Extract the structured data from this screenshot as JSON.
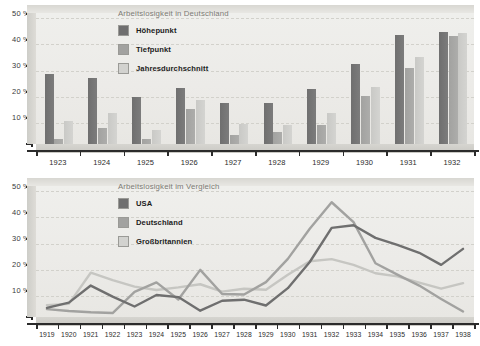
{
  "charts": [
    {
      "id": "unemployment-germany",
      "title": "Arbeitslosigkeit in Deutschland",
      "type": "bar",
      "xlabel": "",
      "ylabel": "",
      "ylim": [
        0,
        50
      ],
      "yticks": [
        "10 %",
        "20 %",
        "30 %",
        "40 %",
        "50 %"
      ],
      "ytick_values": [
        10,
        20,
        30,
        40,
        50
      ],
      "grid": true,
      "legend_position": "top-center",
      "categories": [
        "1923",
        "1924",
        "1925",
        "1926",
        "1927",
        "1928",
        "1929",
        "1930",
        "1931",
        "1932"
      ],
      "series": [
        {
          "name": "Höhepunkt",
          "color": "#6f6f6f",
          "values": [
            26.8,
            25.1,
            18.1,
            21.4,
            15.7,
            15.5,
            21.1,
            30.5,
            41.6,
            42.6
          ]
        },
        {
          "name": "Tiefpunkt",
          "color": "#a2a2a0",
          "values": [
            2.0,
            6.1,
            2.0,
            13.2,
            3.3,
            4.7,
            7.3,
            18.3,
            29.0,
            41.4
          ]
        },
        {
          "name": "Jahresdurchschnitt",
          "color": "#d2d2cf",
          "values": [
            8.9,
            11.8,
            5.3,
            16.8,
            7.5,
            7.1,
            12.0,
            21.7,
            33.3,
            42.4
          ]
        }
      ]
    },
    {
      "id": "unemployment-comparison",
      "title": "Arbeitslosigkeit im Vergleich",
      "type": "line",
      "xlabel": "",
      "ylabel": "",
      "ylim": [
        0,
        50
      ],
      "yticks": [
        "10 %",
        "20 %",
        "30 %",
        "40 %",
        "50 %"
      ],
      "ytick_values": [
        10,
        20,
        30,
        40,
        50
      ],
      "grid": true,
      "legend_position": "top-center",
      "categories": [
        "1919",
        "1920",
        "1921",
        "1922",
        "1923",
        "1924",
        "1925",
        "1926",
        "1927",
        "1928",
        "1929",
        "1930",
        "1931",
        "1932",
        "1933",
        "1934",
        "1935",
        "1936",
        "1937",
        "1938"
      ],
      "series": [
        {
          "name": "USA",
          "color": "#6f6f6f",
          "values": [
            3.5,
            5.5,
            12.0,
            7.8,
            4.0,
            8.4,
            7.6,
            2.4,
            6.2,
            6.6,
            4.4,
            11.0,
            21.0,
            34.0,
            35.0,
            30.2,
            27.5,
            24.5,
            19.9,
            26.0
          ]
        },
        {
          "name": "Deutschland",
          "color": "#a2a2a0",
          "values": [
            3.0,
            2.3,
            1.8,
            1.5,
            9.6,
            13.2,
            6.7,
            18.0,
            8.8,
            8.6,
            13.3,
            22.2,
            33.7,
            43.8,
            36.2,
            20.5,
            16.2,
            12.0,
            6.9,
            2.1
          ]
        },
        {
          "name": "Großbritannien",
          "color": "#c6c6c2",
          "values": [
            4.5,
            5.0,
            16.9,
            14.1,
            11.6,
            10.3,
            11.3,
            12.5,
            9.7,
            10.8,
            10.4,
            16.1,
            21.3,
            22.1,
            19.9,
            16.7,
            15.5,
            13.1,
            10.8,
            12.9
          ]
        }
      ]
    }
  ]
}
